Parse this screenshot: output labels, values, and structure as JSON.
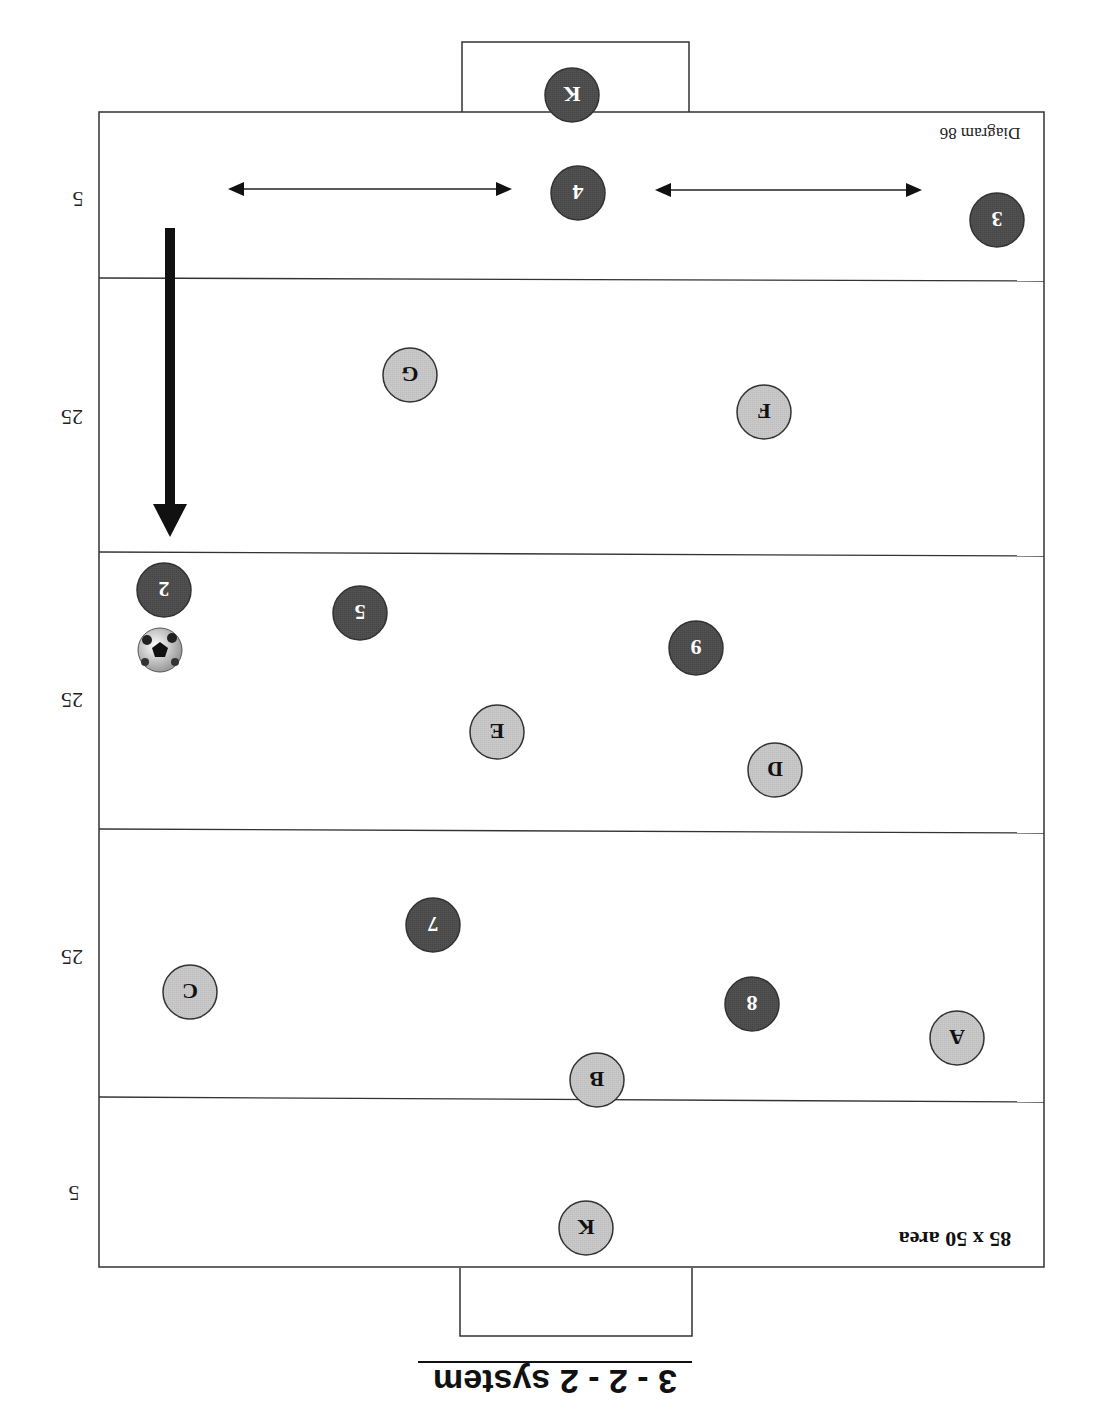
{
  "diagram": {
    "title": "3 - 2 - 2 system",
    "area_label": "85 x 50 area",
    "diagram_label": "Diagram 86",
    "orientation": "rotated 180 degrees",
    "zone_labels": [
      "5",
      "25",
      "25",
      "25",
      "5"
    ],
    "colors": {
      "dark_team": "#505050",
      "light_team": "#c8c8c8",
      "line": "#333333",
      "background": "#ffffff"
    },
    "dark_players": [
      {
        "label": "K",
        "x": 572,
        "y": 95
      },
      {
        "label": "4",
        "x": 578,
        "y": 193
      },
      {
        "label": "3",
        "x": 997,
        "y": 220
      },
      {
        "label": "2",
        "x": 164,
        "y": 590
      },
      {
        "label": "5",
        "x": 360,
        "y": 613
      },
      {
        "label": "9",
        "x": 696,
        "y": 648
      },
      {
        "label": "7",
        "x": 433,
        "y": 925
      },
      {
        "label": "8",
        "x": 752,
        "y": 1004
      }
    ],
    "light_players": [
      {
        "label": "G",
        "x": 410,
        "y": 375
      },
      {
        "label": "F",
        "x": 764,
        "y": 412
      },
      {
        "label": "E",
        "x": 497,
        "y": 732
      },
      {
        "label": "D",
        "x": 775,
        "y": 770
      },
      {
        "label": "C",
        "x": 190,
        "y": 992
      },
      {
        "label": "A",
        "x": 957,
        "y": 1038
      },
      {
        "label": "B",
        "x": 597,
        "y": 1080
      },
      {
        "label": "K",
        "x": 586,
        "y": 1228
      }
    ],
    "ball": {
      "x": 160,
      "y": 650
    },
    "run_arrow": {
      "x": 170,
      "y1": 228,
      "y2": 537
    },
    "double_arrows": [
      {
        "x1": 228,
        "x2": 512,
        "y": 189
      },
      {
        "x1": 655,
        "x2": 922,
        "y": 190
      }
    ]
  }
}
